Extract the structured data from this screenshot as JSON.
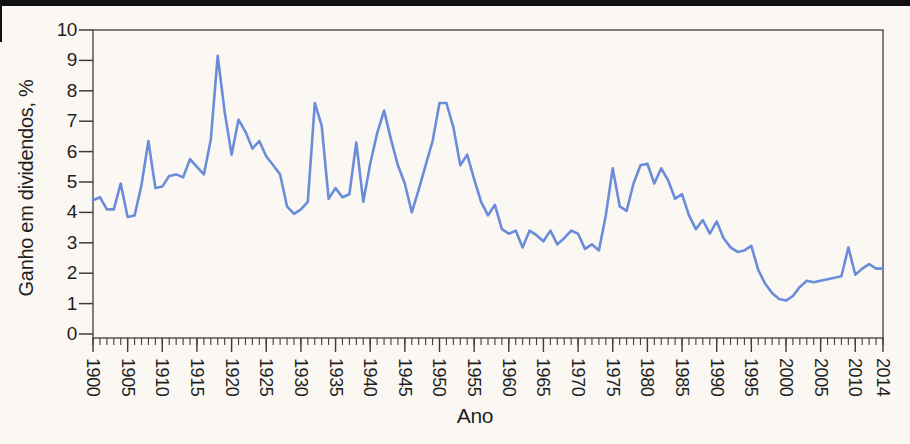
{
  "colors": {
    "background": "#fbf8f4",
    "top_bar": "#111111",
    "axis": "#3d3d3d",
    "text": "#1f1f1f",
    "line": "#6B8CD9"
  },
  "chart_data": {
    "type": "line",
    "xlabel": "Ano",
    "ylabel": "Ganho em dividendos, %",
    "x_start": 1900,
    "x_end": 2014,
    "ylim": [
      0,
      10
    ],
    "y_ticks": [
      0,
      1,
      2,
      3,
      4,
      5,
      6,
      7,
      8,
      9,
      10
    ],
    "x_tick_labels": [
      1900,
      1905,
      1910,
      1915,
      1920,
      1925,
      1930,
      1935,
      1940,
      1945,
      1950,
      1955,
      1960,
      1965,
      1970,
      1975,
      1980,
      1985,
      1990,
      1995,
      2000,
      2005,
      2010,
      2014
    ],
    "grid": false,
    "legend": false,
    "series": [
      {
        "name": "Ganho em dividendos, %",
        "values": [
          4.4,
          4.5,
          4.1,
          4.1,
          4.95,
          3.85,
          3.9,
          4.9,
          6.35,
          4.8,
          4.85,
          5.2,
          5.25,
          5.15,
          5.75,
          5.5,
          5.25,
          6.4,
          9.15,
          7.3,
          5.9,
          7.05,
          6.65,
          6.1,
          6.35,
          5.85,
          5.55,
          5.25,
          4.2,
          3.95,
          4.1,
          4.35,
          7.6,
          6.85,
          4.45,
          4.8,
          4.5,
          4.6,
          6.3,
          4.35,
          5.6,
          6.6,
          7.35,
          6.4,
          5.55,
          4.95,
          4.0,
          4.75,
          5.55,
          6.35,
          7.6,
          7.6,
          6.8,
          5.55,
          5.9,
          5.1,
          4.35,
          3.9,
          4.25,
          3.45,
          3.3,
          3.4,
          2.85,
          3.4,
          3.25,
          3.05,
          3.4,
          2.95,
          3.15,
          3.4,
          3.3,
          2.8,
          2.95,
          2.75,
          3.9,
          5.45,
          4.2,
          4.05,
          4.95,
          5.55,
          5.6,
          4.95,
          5.45,
          5.05,
          4.45,
          4.6,
          3.9,
          3.45,
          3.75,
          3.3,
          3.7,
          3.15,
          2.85,
          2.7,
          2.75,
          2.9,
          2.1,
          1.65,
          1.35,
          1.15,
          1.1,
          1.25,
          1.55,
          1.75,
          1.7,
          1.75,
          1.8,
          1.85,
          1.9,
          2.85,
          1.95,
          2.15,
          2.3,
          2.15,
          2.15
        ]
      }
    ]
  }
}
